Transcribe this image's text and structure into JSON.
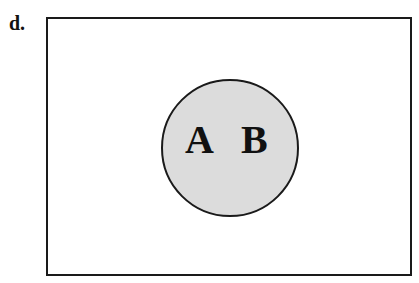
{
  "diagram": {
    "type": "venn",
    "panel_label": "d.",
    "universe": {
      "shape": "rectangle",
      "fill": "#ffffff",
      "stroke": "#1a1a1a"
    },
    "sets": [
      {
        "shape": "circle",
        "labels": [
          "A",
          "B"
        ],
        "fill": "#dcdcdc",
        "stroke": "#1a1a1a"
      }
    ],
    "set_labels": {
      "a": "A",
      "b": "B"
    }
  }
}
